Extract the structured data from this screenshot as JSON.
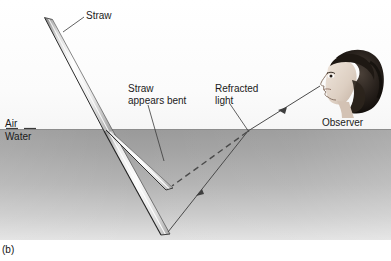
{
  "figure": {
    "panel_label": "(b)",
    "width": 391,
    "height": 261
  },
  "labels": {
    "straw": "Straw",
    "air": "Air",
    "water": "Water",
    "straw_appears_bent": "Straw\nappears bent",
    "refracted_light": "Refracted\nlight",
    "observer": "Observer"
  },
  "colors": {
    "air_fill": "#fbfbfb",
    "water_fill_top": "#9a9a9a",
    "water_fill_bottom": "#e2e2e2",
    "surface_line": "#8c8c8c",
    "ray_line": "#4a4a4a",
    "leader_line": "#3a3a3a",
    "straw_outline": "#2b2b2b",
    "straw_body": "#f2f2f2",
    "text": "#1a1a1a"
  },
  "diagram": {
    "type": "optics-refraction",
    "surface_y": 130,
    "entry_point": [
      108,
      130
    ],
    "real_straw": {
      "top": [
        48,
        18
      ],
      "surface": [
        108,
        130
      ],
      "tip": [
        166,
        234
      ]
    },
    "apparent_straw": {
      "surface": [
        110,
        131
      ],
      "tip": [
        170,
        185
      ]
    },
    "refracted_ray": {
      "from_tip": [
        168,
        232
      ],
      "surface_point": [
        248,
        131
      ],
      "to_eye": [
        320,
        86
      ],
      "arrow_positions": [
        [
          200,
          192
        ],
        [
          282,
          110
        ]
      ]
    },
    "sight_line_dashed": {
      "from": [
        247,
        132
      ],
      "to": [
        172,
        186
      ]
    },
    "leaders": [
      {
        "name": "straw-leader",
        "from": [
          84,
          17
        ],
        "to": [
          63,
          32
        ]
      },
      {
        "name": "bent-leader",
        "from": [
          148,
          104
        ],
        "to": [
          163,
          160
        ]
      },
      {
        "name": "refracted-leader",
        "from": [
          230,
          104
        ],
        "to": [
          249,
          132
        ]
      },
      {
        "name": "observer-leader",
        "from": [
          320,
          120
        ],
        "to": [
          330,
          112
        ]
      }
    ]
  }
}
